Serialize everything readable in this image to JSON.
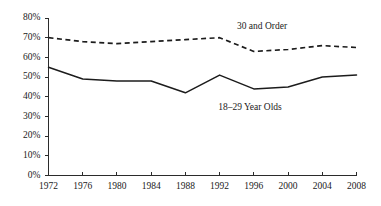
{
  "chart_data": {
    "type": "line",
    "title": "",
    "subtitle": "",
    "xlabel": "",
    "ylabel": "",
    "x": [
      1972,
      1976,
      1980,
      1984,
      1988,
      1992,
      1996,
      2000,
      2004,
      2008
    ],
    "categories": [
      "1972",
      "1976",
      "1980",
      "1984",
      "1988",
      "1992",
      "1996",
      "2000",
      "2004",
      "2008"
    ],
    "xlim": [
      1972,
      2008
    ],
    "ylim": [
      0,
      80
    ],
    "y_tick_labels": [
      "0%",
      "10%",
      "20%",
      "30%",
      "40%",
      "50%",
      "60%",
      "70%",
      "80%"
    ],
    "y_tick_values": [
      0,
      10,
      20,
      30,
      40,
      50,
      60,
      70,
      80
    ],
    "grid": false,
    "legend": "inline-annotations",
    "series": [
      {
        "name": "30 and Order",
        "style": "dashed",
        "color": "#1c1c1c",
        "values": [
          70,
          68,
          67,
          68,
          69,
          70,
          63,
          64,
          66,
          65
        ],
        "label_x": 1996,
        "label_y": 75
      },
      {
        "name": "18–29 Year Olds",
        "style": "solid",
        "color": "#1c1c1c",
        "values": [
          55,
          49,
          48,
          48,
          42,
          51,
          44,
          45,
          50,
          51
        ],
        "label_x": 1994,
        "label_y": 35
      }
    ],
    "annotations": [
      {
        "text": "30 and Order",
        "series": "30 and Order"
      },
      {
        "text": "18–29 Year Olds",
        "series": "18–29 Year Olds"
      }
    ]
  },
  "axes": {
    "y_axis_name": "percentage-axis",
    "x_axis_name": "year-axis"
  }
}
